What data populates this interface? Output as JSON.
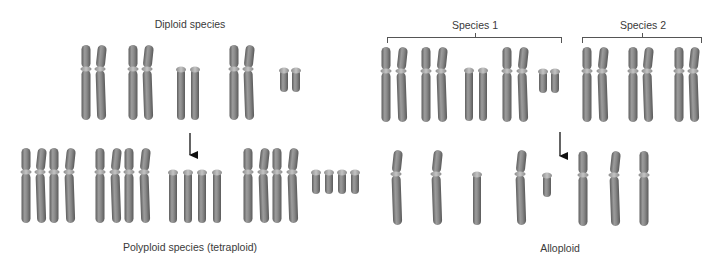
{
  "labels": {
    "diploid": "Diploid species",
    "polyploid": "Polyploid species (tetraploid)",
    "species1": "Species 1",
    "species2": "Species 2",
    "alloploid": "Alloploid"
  },
  "colors": {
    "chromosome_dark": "#6f6f6f",
    "chromosome_light": "#9a9a9a",
    "centromere": "#a8a8a8",
    "arrow": "#111111",
    "text": "#3a3a3a"
  },
  "panels": {
    "autopolyploidy": {
      "parent_title": "Diploid species",
      "parent_chromosome_sets": [
        {
          "type": "metacentric-large",
          "count": 2
        },
        {
          "type": "metacentric-large",
          "count": 2
        },
        {
          "type": "acrocentric",
          "count": 2
        },
        {
          "type": "metacentric-large",
          "count": 2
        },
        {
          "type": "small-acrocentric",
          "count": 2
        }
      ],
      "result_title": "Polyploid species (tetraploid)",
      "result_chromosome_sets": [
        {
          "type": "metacentric-large",
          "count": 4
        },
        {
          "type": "metacentric-large",
          "count": 4
        },
        {
          "type": "acrocentric",
          "count": 4
        },
        {
          "type": "metacentric-large",
          "count": 4
        },
        {
          "type": "small-acrocentric",
          "count": 4
        }
      ]
    },
    "allopolyploidy": {
      "parents": [
        {
          "title": "Species 1",
          "chromosome_sets": [
            {
              "type": "metacentric-large",
              "count": 2
            },
            {
              "type": "metacentric-large",
              "count": 2
            },
            {
              "type": "acrocentric",
              "count": 2
            },
            {
              "type": "metacentric-large",
              "count": 2
            },
            {
              "type": "small-acrocentric",
              "count": 2
            }
          ]
        },
        {
          "title": "Species 2",
          "chromosome_sets": [
            {
              "type": "metacentric-large",
              "count": 2
            },
            {
              "type": "metacentric-large",
              "count": 2
            },
            {
              "type": "metacentric-large",
              "count": 2
            }
          ]
        }
      ],
      "result_title": "Alloploid",
      "result_chromosomes": [
        "metacentric-large",
        "metacentric-large",
        "acrocentric",
        "metacentric-large",
        "small-acrocentric",
        "metacentric-large",
        "metacentric-large",
        "metacentric-large"
      ]
    }
  }
}
